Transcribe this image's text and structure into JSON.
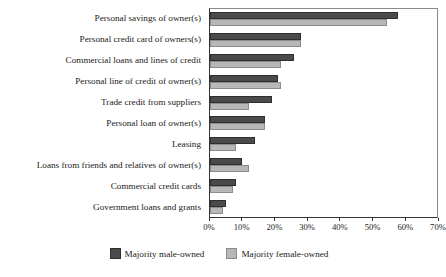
{
  "chart_data": {
    "type": "bar",
    "orientation": "horizontal",
    "title": "",
    "subtitle": "",
    "xlabel": "",
    "ylabel": "",
    "xlim": [
      0,
      70
    ],
    "grid": false,
    "legend_position": "bottom",
    "xticks": [
      "0%",
      "10%",
      "20%",
      "30%",
      "40%",
      "50%",
      "60%",
      "70%"
    ],
    "xtick_values": [
      0,
      10,
      20,
      30,
      40,
      50,
      60,
      70
    ],
    "categories": [
      "Personal savings of owner(s)",
      "Personal credit card of owners(s)",
      "Commercial loans and lines of credit",
      "Personal line of credit of owner(s)",
      "Trade credit from suppliers",
      "Personal loan of owner(s)",
      "Leasing",
      "Loans from friends and relatives of owner(s)",
      "Commercial credit cards",
      "Government loans and grants"
    ],
    "series": [
      {
        "name": "Majority male-owned",
        "color": "#4a4a4a",
        "values": [
          58,
          28,
          26,
          21,
          19,
          17,
          14,
          10,
          8,
          5
        ]
      },
      {
        "name": "Majority female-owned",
        "color": "#b7b7b7",
        "values": [
          54.5,
          28,
          22,
          22,
          12,
          17,
          8,
          12,
          7,
          4
        ]
      }
    ]
  }
}
